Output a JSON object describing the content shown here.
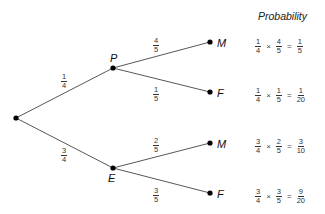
{
  "title": "Probability",
  "nodes": {
    "root": {
      "label": ""
    },
    "first": [
      {
        "label": "P",
        "branch": {
          "num": "1",
          "den": "4"
        }
      },
      {
        "label": "E",
        "branch": {
          "num": "3",
          "den": "4"
        }
      }
    ],
    "second": [
      {
        "label": "M",
        "branch": {
          "num": "4",
          "den": "5"
        }
      },
      {
        "label": "F",
        "branch": {
          "num": "1",
          "den": "5"
        }
      },
      {
        "label": "M",
        "branch": {
          "num": "2",
          "den": "5"
        }
      },
      {
        "label": "F",
        "branch": {
          "num": "3",
          "den": "5"
        }
      }
    ]
  },
  "calculations": [
    {
      "a": {
        "num": "1",
        "den": "4"
      },
      "b": {
        "num": "4",
        "den": "5"
      },
      "r": {
        "num": "1",
        "den": "5"
      }
    },
    {
      "a": {
        "num": "1",
        "den": "4"
      },
      "b": {
        "num": "1",
        "den": "5"
      },
      "r": {
        "num": "1",
        "den": "20"
      }
    },
    {
      "a": {
        "num": "3",
        "den": "4"
      },
      "b": {
        "num": "2",
        "den": "5"
      },
      "r": {
        "num": "3",
        "den": "10"
      }
    },
    {
      "a": {
        "num": "3",
        "den": "4"
      },
      "b": {
        "num": "3",
        "den": "5"
      },
      "r": {
        "num": "9",
        "den": "20"
      }
    }
  ],
  "symbols": {
    "times": "×",
    "equals": "="
  }
}
